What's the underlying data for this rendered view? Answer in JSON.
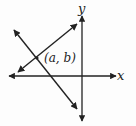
{
  "diagram": {
    "type": "coordinate-plane-two-lines",
    "axes": {
      "x_label": "x",
      "y_label": "y",
      "color": "#222222"
    },
    "lines": [
      {
        "name": "increasing-line",
        "from": [
          18,
          72
        ],
        "to": [
          77,
          24
        ],
        "arrows": "both"
      },
      {
        "name": "decreasing-line",
        "from": [
          14,
          30
        ],
        "to": [
          77,
          109
        ],
        "arrows": "both"
      }
    ],
    "intersection": {
      "label": "(a, b)",
      "point": [
        37,
        58
      ]
    },
    "stroke_color": "#222222"
  }
}
